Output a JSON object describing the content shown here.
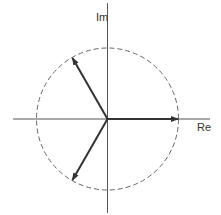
{
  "diagram": {
    "type": "phasor-diagram",
    "axes": {
      "horizontal_label": "Re",
      "vertical_label": "Im"
    },
    "circle": {
      "style": "dashed",
      "center": [
        107.5,
        119
      ],
      "radius": 71
    },
    "phasors": [
      {
        "name": "phasor-0deg",
        "angle_deg": 0
      },
      {
        "name": "phasor-120deg",
        "angle_deg": 120
      },
      {
        "name": "phasor-240deg",
        "angle_deg": 240
      }
    ],
    "colors": {
      "axis": "#555555",
      "circle": "#666666",
      "phasor": "#333333",
      "background": "#ffffff"
    }
  }
}
